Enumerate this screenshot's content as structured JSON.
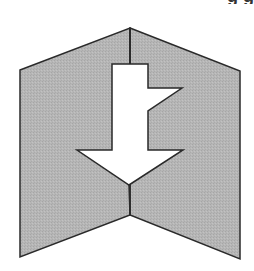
{
  "diagram": {
    "description": "Folded card (two panels joined at a vertical center crease) with a downward-pointing arrow cut out across the fold",
    "panel_fill": "#b4b4b4",
    "stroke_color": "#2a2a2a",
    "arrow_fill": "#ffffff",
    "background": "#ffffff",
    "icon": "fold-down-arrow-icon",
    "panels": {
      "left": "left-panel",
      "right": "right-panel"
    },
    "cut_off_top_text": "g   g"
  }
}
